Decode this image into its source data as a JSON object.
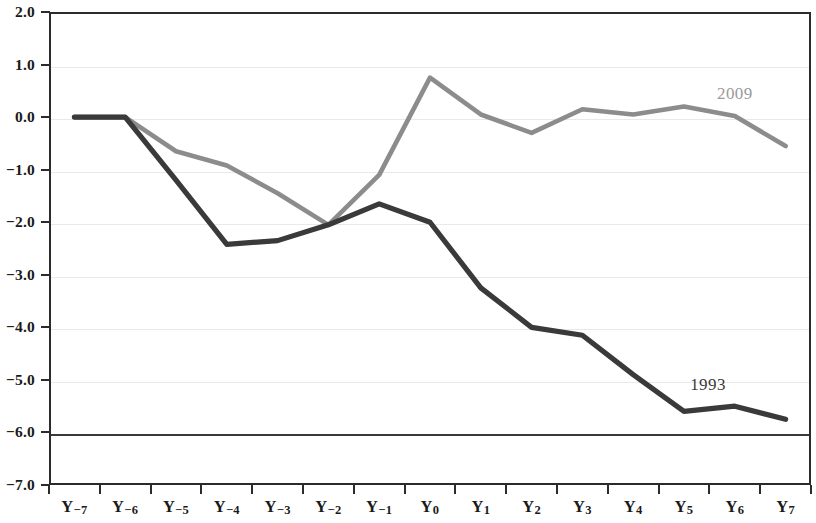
{
  "chart_data": {
    "type": "line",
    "title": "",
    "subtitle": "",
    "xlabel": "",
    "ylabel": "",
    "categories": [
      "Y-7",
      "Y-6",
      "Y-5",
      "Y-4",
      "Y-3",
      "Y-2",
      "Y-1",
      "Y0",
      "Y1",
      "Y2",
      "Y3",
      "Y4",
      "Y5",
      "Y6",
      "Y7"
    ],
    "category_labels": [
      {
        "prefix": "Y",
        "sub": "-7"
      },
      {
        "prefix": "Y",
        "sub": "-6"
      },
      {
        "prefix": "Y",
        "sub": "-5"
      },
      {
        "prefix": "Y",
        "sub": "-4"
      },
      {
        "prefix": "Y",
        "sub": "-3"
      },
      {
        "prefix": "Y",
        "sub": "-2"
      },
      {
        "prefix": "Y",
        "sub": "-1"
      },
      {
        "prefix": "Y",
        "sub": "0"
      },
      {
        "prefix": "Y",
        "sub": "1"
      },
      {
        "prefix": "Y",
        "sub": "2"
      },
      {
        "prefix": "Y",
        "sub": "3"
      },
      {
        "prefix": "Y",
        "sub": "4"
      },
      {
        "prefix": "Y",
        "sub": "5"
      },
      {
        "prefix": "Y",
        "sub": "6"
      },
      {
        "prefix": "Y",
        "sub": "7"
      }
    ],
    "series": [
      {
        "name": "2009",
        "color": "#8c8c8c",
        "label_text": "2009",
        "values": [
          0.0,
          0.0,
          -0.65,
          -0.92,
          -1.45,
          -2.05,
          -1.1,
          0.75,
          0.05,
          -0.3,
          0.15,
          0.05,
          0.2,
          0.02,
          -0.55
        ]
      },
      {
        "name": "1993",
        "color": "#3a3a3a",
        "label_text": "1993",
        "values": [
          0.0,
          0.0,
          -1.2,
          -2.42,
          -2.35,
          -2.05,
          -1.65,
          -2.0,
          -3.25,
          -4.0,
          -4.15,
          -4.9,
          -5.6,
          -5.5,
          -5.75
        ]
      }
    ],
    "ylim": [
      -7.0,
      2.0
    ],
    "ytick_values": [
      2.0,
      1.0,
      0.0,
      -1.0,
      -2.0,
      -3.0,
      -4.0,
      -5.0,
      -6.0,
      -7.0
    ],
    "ytick_labels": [
      "2.0",
      "1.0",
      "0.0",
      "-1.0",
      "-2.0",
      "-3.0",
      "-4.0",
      "-5.0",
      "-6.0",
      "-7.0"
    ],
    "grid": true,
    "grid_axis": "y",
    "emphasis_gridlines": [
      -6.0
    ],
    "legend": "inline-series-labels",
    "legend_position": "right-inline"
  },
  "annotations": {
    "series_label_2009": "2009",
    "series_label_1993": "1993"
  }
}
